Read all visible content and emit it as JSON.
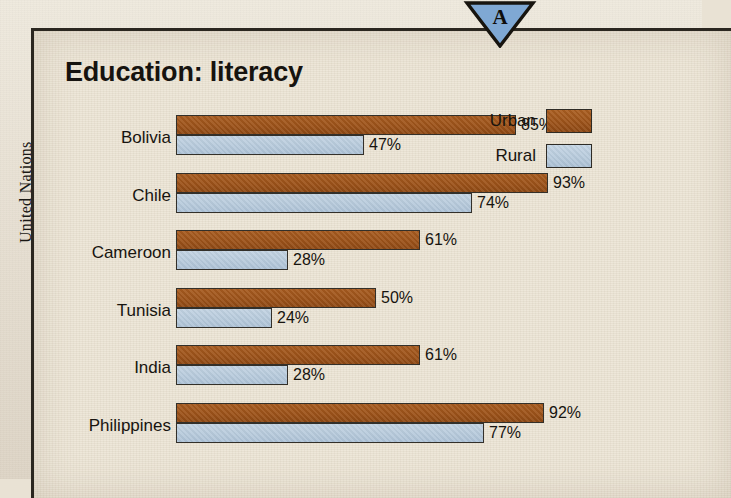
{
  "marker": {
    "label": "A",
    "icon": "triangle-down-marker-icon",
    "fill": "#7fa8d4"
  },
  "credit": {
    "text": "United Nations"
  },
  "chart": {
    "title": "Education: literacy",
    "legend": [
      {
        "label": "Urban",
        "color": "#9c5219"
      },
      {
        "label": "Rural",
        "color": "#b6c9db"
      }
    ]
  },
  "chart_data": {
    "type": "bar",
    "orientation": "horizontal",
    "title": "Education: literacy",
    "xlabel": "",
    "ylabel": "",
    "unit": "%",
    "xlim": [
      0,
      100
    ],
    "grid": false,
    "legend_position": "right",
    "categories": [
      "Bolivia",
      "Chile",
      "Cameroon",
      "Tunisia",
      "India",
      "Philippines"
    ],
    "series": [
      {
        "name": "Urban",
        "color": "#9c5219",
        "values": [
          85,
          93,
          61,
          50,
          61,
          92
        ],
        "labels": [
          "85%",
          "93%",
          "61%",
          "50%",
          "61%",
          "92%"
        ]
      },
      {
        "name": "Rural",
        "color": "#b6c9db",
        "values": [
          47,
          74,
          28,
          24,
          28,
          77
        ],
        "labels": [
          "47%",
          "74%",
          "28%",
          "24%",
          "28%",
          "77%"
        ]
      }
    ]
  }
}
